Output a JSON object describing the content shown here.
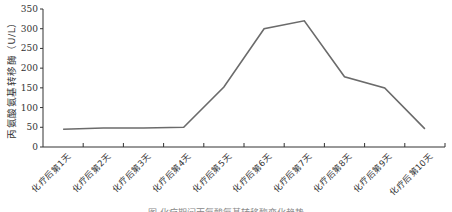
{
  "chart_data": {
    "type": "line",
    "title": "",
    "xlabel": "",
    "ylabel": "丙氨酸氨基转移酶（U/L）",
    "ylim": [
      0,
      350
    ],
    "yticks": [
      0,
      50,
      100,
      150,
      200,
      250,
      300,
      350
    ],
    "grid": false,
    "legend": null,
    "categories": [
      "化疗后第1天",
      "化疗后第2天",
      "化疗后第3天",
      "化疗后第4天",
      "化疗后第5天",
      "化疗后第6天",
      "化疗后第7天",
      "化疗后第8天",
      "化疗后第9天",
      "化疗后第10天"
    ],
    "series": [
      {
        "name": "丙氨酸氨基转移酶",
        "values": [
          45,
          48,
          48,
          50,
          152,
          300,
          320,
          178,
          150,
          46
        ],
        "color": "#6b6b6b"
      }
    ]
  },
  "caption": "图 化疗期间丙氨酸氨基转移酶变化趋势"
}
